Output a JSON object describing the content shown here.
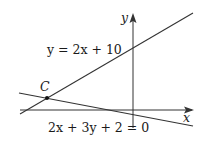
{
  "diagram": {
    "title": "",
    "axes": {
      "x_label": "x",
      "y_label": "y"
    },
    "lines": [
      {
        "equation_label": "y = 2x + 10"
      },
      {
        "equation_label": "2x + 3y + 2 = 0"
      }
    ],
    "points": [
      {
        "label": "C",
        "description": "intersection of the two lines"
      }
    ],
    "colors": {
      "stroke": "#333333",
      "background": "#ffffff"
    }
  }
}
